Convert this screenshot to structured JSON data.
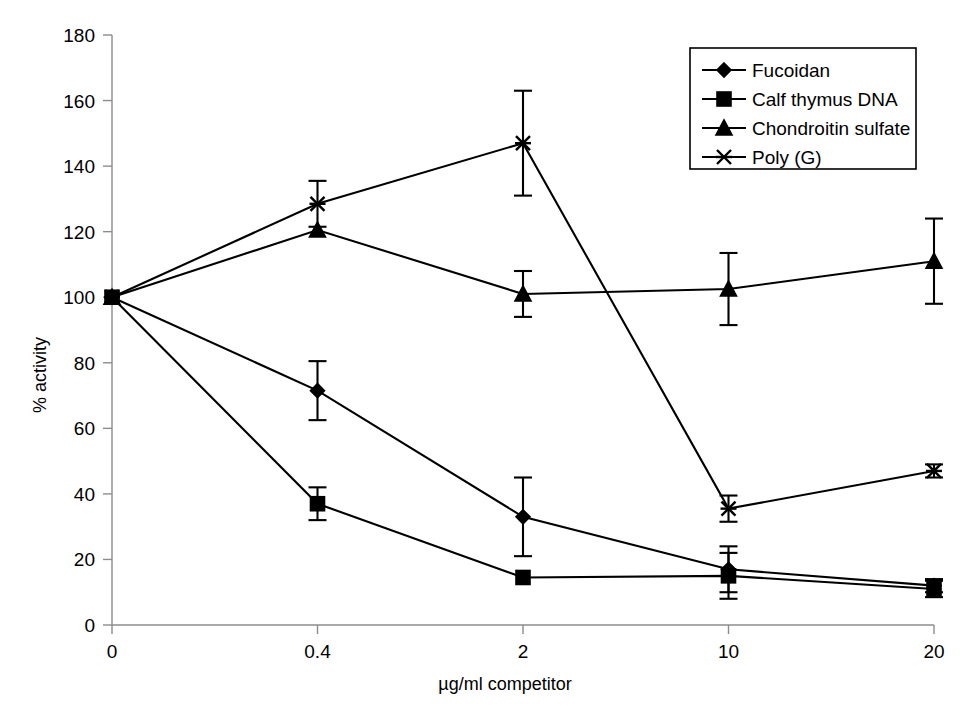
{
  "chart_data": {
    "type": "line",
    "title": "",
    "xlabel": "µg/ml competitor",
    "ylabel": "% activity",
    "categories": [
      "0",
      "0.4",
      "2",
      "10",
      "20"
    ],
    "ylim": [
      0,
      180
    ],
    "yticks": [
      0,
      20,
      40,
      60,
      80,
      100,
      120,
      140,
      160,
      180
    ],
    "grid": false,
    "legend_position": "top-right",
    "series": [
      {
        "name": "Fucoidan",
        "marker": "diamond",
        "values": [
          100,
          71.5,
          33,
          17,
          12
        ],
        "errors": [
          0,
          9,
          12,
          7,
          2
        ]
      },
      {
        "name": "Calf thymus DNA",
        "marker": "square",
        "values": [
          100,
          37,
          14.5,
          15,
          11
        ],
        "errors": [
          0,
          5,
          0,
          7,
          2.5
        ]
      },
      {
        "name": "Chondroitin sulfate",
        "marker": "triangle",
        "values": [
          100,
          120.5,
          101,
          102.5,
          111
        ],
        "errors": [
          0,
          0,
          7,
          11,
          13
        ]
      },
      {
        "name": "Poly (G)",
        "marker": "cross",
        "values": [
          100,
          128.5,
          147,
          35.5,
          47
        ],
        "errors": [
          0,
          7,
          16,
          4,
          2
        ]
      }
    ]
  },
  "legend": {
    "entries": [
      {
        "label": "Fucoidan",
        "marker": "diamond"
      },
      {
        "label": "Calf thymus DNA",
        "marker": "square"
      },
      {
        "label": "Chondroitin sulfate",
        "marker": "triangle"
      },
      {
        "label": "Poly (G)",
        "marker": "cross"
      }
    ]
  },
  "axes": {
    "y_tick_labels": [
      "180",
      "160",
      "140",
      "120",
      "100",
      "80",
      "60",
      "40",
      "20",
      "0"
    ],
    "x_tick_labels": [
      "0",
      "0.4",
      "2",
      "10",
      "20"
    ],
    "y_title": "% activity",
    "x_title": "µg/ml competitor"
  },
  "colors": {
    "series": "#000000",
    "axis": "#8c8c8c",
    "background": "#ffffff"
  }
}
